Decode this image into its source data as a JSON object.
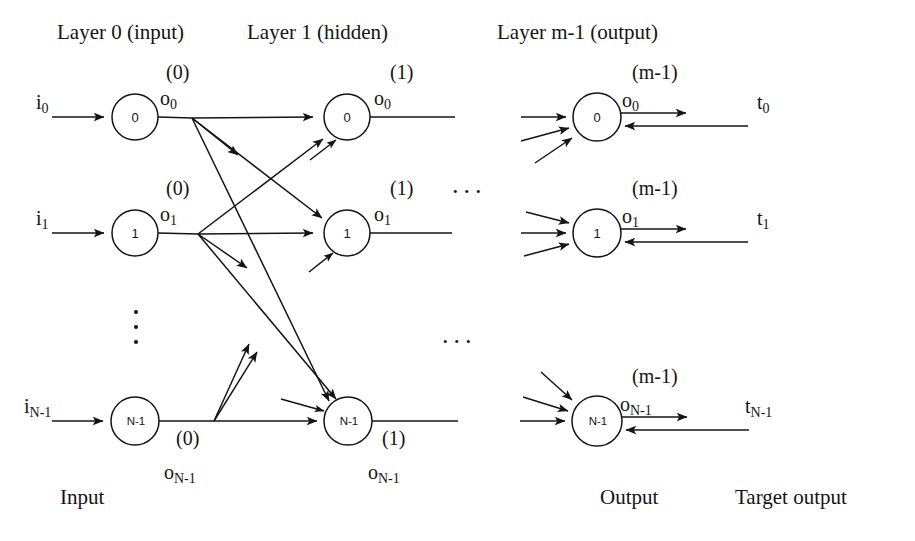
{
  "figure": {
    "background_color": "#ffffff",
    "stroke_color": "#141414"
  },
  "headers": [
    {
      "id": "layer0",
      "text": "Layer 0 (input)",
      "x": 57,
      "y": 22
    },
    {
      "id": "layer1",
      "text": "Layer 1 (hidden)",
      "x": 247,
      "y": 22
    },
    {
      "id": "layerm1",
      "text": "Layer m-1 (output)",
      "x": 497,
      "y": 22
    }
  ],
  "footers": [
    {
      "id": "input",
      "text": "Input",
      "x": 60,
      "y": 487
    },
    {
      "id": "output",
      "text": "Output",
      "x": 600,
      "y": 487
    },
    {
      "id": "target-output",
      "text": "Target output",
      "x": 735,
      "y": 487
    }
  ],
  "input_layer": {
    "name": "Layer 0 (input)",
    "nodes": [
      {
        "id": "in-0",
        "label": "0",
        "cx": 135,
        "cy": 117,
        "r": 23
      },
      {
        "id": "in-1",
        "label": "1",
        "cx": 135,
        "cy": 233,
        "r": 23
      },
      {
        "id": "in-n",
        "label": "N-1",
        "cx": 135,
        "cy": 421,
        "r": 24
      }
    ],
    "input_signals": [
      {
        "id": "i0",
        "base": "i",
        "sub": "0",
        "x": 36,
        "y": 92
      },
      {
        "id": "i1",
        "base": "i",
        "sub": "1",
        "x": 36,
        "y": 208
      },
      {
        "id": "iN1",
        "base": "i",
        "sub": "N-1",
        "x": 24,
        "y": 396
      }
    ],
    "output_signals": [
      {
        "id": "o0-0",
        "sup": "(0)",
        "base": "o",
        "sub": "0",
        "sup_x": 166,
        "sup_y": 62,
        "var_x": 160,
        "var_y": 88
      },
      {
        "id": "o1-0",
        "sup": "(0)",
        "base": "o",
        "sub": "1",
        "sup_x": 166,
        "sup_y": 178,
        "var_x": 160,
        "var_y": 204
      },
      {
        "id": "oN1-0",
        "sup": "(0)",
        "base": "o",
        "sub": "N-1",
        "sup_x": 176,
        "sup_y": 428,
        "var_x": 164,
        "var_y": 462
      }
    ]
  },
  "hidden_layer": {
    "name": "Layer 1 (hidden)",
    "nodes": [
      {
        "id": "hid-0",
        "label": "0",
        "cx": 347,
        "cy": 117,
        "r": 23
      },
      {
        "id": "hid-1",
        "label": "1",
        "cx": 347,
        "cy": 233,
        "r": 23
      },
      {
        "id": "hid-n",
        "label": "N-1",
        "cx": 348,
        "cy": 421,
        "r": 24
      }
    ],
    "output_signals": [
      {
        "id": "o0-1",
        "sup": "(1)",
        "base": "o",
        "sub": "0",
        "sup_x": 390,
        "sup_y": 62,
        "var_x": 374,
        "var_y": 88
      },
      {
        "id": "o1-1",
        "sup": "(1)",
        "base": "o",
        "sub": "1",
        "sup_x": 390,
        "sup_y": 178,
        "var_x": 374,
        "var_y": 204
      },
      {
        "id": "oN1-1",
        "sup": "(1)",
        "base": "o",
        "sub": "N-1",
        "sup_x": 382,
        "sup_y": 428,
        "var_x": 368,
        "var_y": 462
      }
    ]
  },
  "output_layer": {
    "name": "Layer m-1 (output)",
    "nodes": [
      {
        "id": "out-0",
        "label": "0",
        "cx": 597,
        "cy": 117,
        "r": 24
      },
      {
        "id": "out-1",
        "label": "1",
        "cx": 597,
        "cy": 233,
        "r": 24
      },
      {
        "id": "out-n",
        "label": "N-1",
        "cx": 597,
        "cy": 421,
        "r": 25
      }
    ],
    "output_signals": [
      {
        "id": "o0-m",
        "sup": "(m-1)",
        "base": "o",
        "sub": "0",
        "sup_x": 632,
        "sup_y": 62,
        "var_x": 622,
        "var_y": 90
      },
      {
        "id": "o1-m",
        "sup": "(m-1)",
        "base": "o",
        "sub": "1",
        "sup_x": 632,
        "sup_y": 178,
        "var_x": 622,
        "var_y": 206
      },
      {
        "id": "oN1-m",
        "sup": "(m-1)",
        "base": "o",
        "sub": "N-1",
        "sup_x": 632,
        "sup_y": 366,
        "var_x": 620,
        "var_y": 394
      }
    ],
    "target_signals": [
      {
        "id": "t0",
        "base": "t",
        "sub": "0",
        "x": 757,
        "y": 92
      },
      {
        "id": "t1",
        "base": "t",
        "sub": "1",
        "x": 757,
        "y": 208
      },
      {
        "id": "tN1",
        "base": "t",
        "sub": "N-1",
        "x": 745,
        "y": 396
      }
    ]
  },
  "ellipses": {
    "horizontal": [
      {
        "id": "hdots-top",
        "text": "...",
        "x": 452,
        "y": 172
      },
      {
        "id": "hdots-bottom",
        "text": "...",
        "x": 442,
        "y": 322
      }
    ],
    "vertical_dots": [
      {
        "id": "vdot-1",
        "cx": 136,
        "cy": 312
      },
      {
        "id": "vdot-2",
        "cx": 136,
        "cy": 327
      },
      {
        "id": "vdot-3",
        "cx": 136,
        "cy": 342
      }
    ]
  }
}
